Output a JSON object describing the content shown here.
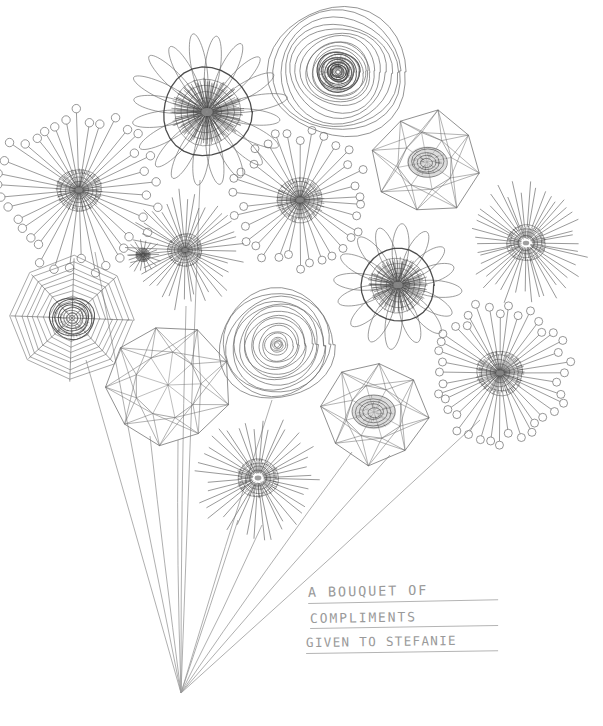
{
  "artwork": {
    "title": "A Bouquet of Compliments",
    "medium": "pencil line drawing",
    "background_color": "#ffffff",
    "ink_color": "#6e6e6e",
    "dark_ink_color": "#3a3a3a",
    "caption_color": "#9a9a9a",
    "width": 603,
    "height": 726
  },
  "caption": {
    "lines": [
      "A BOUQUET OF",
      "COMPLIMENTS",
      "GIVEN TO STEFANIE"
    ],
    "line1": "A BOUQUET OF",
    "line2": "COMPLIMENTS",
    "line3": "GIVEN TO STEFANIE",
    "underlined": true
  },
  "bouquet": {
    "stem_origin": {
      "x": 181,
      "y": 693
    },
    "stem_color": "#9c9c9c",
    "flower_count": 16,
    "stem_count": 12
  },
  "flowers": [
    {
      "id": "f01",
      "name": "pinwheel-dandelion-upper-left",
      "type": "pin",
      "cx": 79,
      "cy": 190,
      "r": 72,
      "rays": 38,
      "core_r": 22,
      "core_style": "dense-dark",
      "tip": "circle",
      "tip_r": 4.2,
      "rotation": 4,
      "stem": true
    },
    {
      "id": "f02",
      "name": "loop-petal-daisy-top-left",
      "type": "daisy",
      "cx": 207,
      "cy": 112,
      "r": 78,
      "petals": 20,
      "petal_w": 13,
      "core_r": 34,
      "core_style": "dense-dark",
      "ring": true,
      "rotation": 8,
      "stem": false
    },
    {
      "id": "f03",
      "name": "concentric-spiral-top",
      "type": "spiral",
      "cx": 338,
      "cy": 72,
      "r": 68,
      "rings": 13,
      "core_r": 21,
      "core_style": "dark-rings",
      "rotation": 0,
      "stem": false
    },
    {
      "id": "f04",
      "name": "net-polygon-upper-right",
      "type": "netpoly",
      "cx": 427,
      "cy": 162,
      "r": 52,
      "sides": 8,
      "core_r": 20,
      "core_style": "shaded-ellipse",
      "rotation": 12,
      "stem": false
    },
    {
      "id": "f05",
      "name": "starburst-mid-left",
      "type": "star",
      "cx": 185,
      "cy": 250,
      "r": 55,
      "rays": 44,
      "core_r": 17,
      "core_style": "dense-dark",
      "rotation": 3,
      "stem": false
    },
    {
      "id": "f06",
      "name": "pinwheel-dandelion-center",
      "type": "pin",
      "cx": 300,
      "cy": 200,
      "r": 60,
      "rays": 34,
      "core_r": 23,
      "core_style": "dense-dark",
      "tip": "circle",
      "tip_r": 4.0,
      "rotation": 6,
      "stem": false
    },
    {
      "id": "f07",
      "name": "starburst-right",
      "type": "star",
      "cx": 526,
      "cy": 243,
      "r": 58,
      "rays": 46,
      "core_r": 19,
      "core_style": "dense-ring",
      "rotation": 7,
      "stem": false
    },
    {
      "id": "f08",
      "name": "loop-petal-daisy-right",
      "type": "daisy",
      "cx": 398,
      "cy": 285,
      "r": 62,
      "petals": 16,
      "petal_w": 14,
      "core_r": 28,
      "core_style": "dense-dark",
      "ring": true,
      "rotation": 5,
      "stem": false
    },
    {
      "id": "f09",
      "name": "octagon-spiderweb-left",
      "type": "web",
      "cx": 72,
      "cy": 318,
      "r": 62,
      "sides": 8,
      "webs": 11,
      "core_r": 22,
      "core_style": "dark-rings",
      "rotation": 2,
      "stem": true
    },
    {
      "id": "f10",
      "name": "concentric-spiral-center",
      "type": "spiral",
      "cx": 277,
      "cy": 345,
      "r": 57,
      "rings": 15,
      "core_r": 6,
      "core_style": "light",
      "rotation": 0,
      "stem": false
    },
    {
      "id": "f11",
      "name": "net-polygon-lower-left",
      "type": "netpoly",
      "cx": 168,
      "cy": 385,
      "r": 60,
      "sides": 9,
      "core_r": 0,
      "core_style": "none",
      "rotation": 18,
      "stem": true
    },
    {
      "id": "f12",
      "name": "pinwheel-dandelion-lower-right",
      "type": "pin",
      "cx": 500,
      "cy": 373,
      "r": 62,
      "rays": 40,
      "core_r": 23,
      "core_style": "dense-dark",
      "tip": "circle",
      "tip_r": 4.0,
      "rotation": 9,
      "stem": true
    },
    {
      "id": "f13",
      "name": "net-polygon-bottom-center",
      "type": "netpoly",
      "cx": 374,
      "cy": 412,
      "r": 52,
      "sides": 8,
      "core_r": 22,
      "core_style": "shaded-ellipse",
      "rotation": 6,
      "stem": true
    },
    {
      "id": "f14",
      "name": "starburst-bottom",
      "type": "star",
      "cx": 258,
      "cy": 478,
      "r": 58,
      "rays": 40,
      "core_r": 20,
      "core_style": "dense-ring",
      "rotation": 4,
      "stem": true
    },
    {
      "id": "f15",
      "name": "starburst-small-inner",
      "type": "star",
      "cx": 143,
      "cy": 255,
      "r": 18,
      "rays": 18,
      "core_r": 7,
      "core_style": "dense-dark",
      "rotation": 0,
      "stem": false
    },
    {
      "id": "f16",
      "name": "spiral-inner-top-accent",
      "type": "spiral",
      "cx": 338,
      "cy": 72,
      "r": 30,
      "rings": 6,
      "core_r": 10,
      "core_style": "dark-rings",
      "rotation": 0,
      "stem": false
    }
  ],
  "stems": [
    {
      "name": "stem-to-spiderweb-left",
      "to_x": 86,
      "to_y": 360
    },
    {
      "name": "stem-to-netpoly-lower-left",
      "to_x": 150,
      "to_y": 436
    },
    {
      "name": "stem-to-netpoly-lower-left-b",
      "to_x": 178,
      "to_y": 440
    },
    {
      "name": "stem-to-starburst-bottom",
      "to_x": 238,
      "to_y": 520
    },
    {
      "name": "stem-to-starburst-bottom-b",
      "to_x": 262,
      "to_y": 525
    },
    {
      "name": "stem-to-daisy-top-left",
      "to_x": 200,
      "to_y": 180
    },
    {
      "name": "stem-to-pin-upper-left",
      "to_x": 95,
      "to_y": 252
    },
    {
      "name": "stem-to-starburst-mid-left",
      "to_x": 186,
      "to_y": 306
    },
    {
      "name": "stem-to-spiral-center",
      "to_x": 272,
      "to_y": 400
    },
    {
      "name": "stem-to-netpoly-bottom",
      "to_x": 352,
      "to_y": 452
    },
    {
      "name": "stem-to-netpoly-bottom-b",
      "to_x": 390,
      "to_y": 455
    },
    {
      "name": "stem-to-pin-lower-right",
      "to_x": 480,
      "to_y": 420
    }
  ]
}
